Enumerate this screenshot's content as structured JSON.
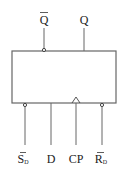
{
  "diagram": {
    "type": "D flip-flop logic symbol",
    "outputs": [
      {
        "label": "Q",
        "overbar": true,
        "inverted_bubble": true
      },
      {
        "label": "Q",
        "overbar": false,
        "inverted_bubble": false
      }
    ],
    "inputs": [
      {
        "label": "S",
        "subscript": "D",
        "overbar": true,
        "inverted_bubble": true
      },
      {
        "label": "D",
        "subscript": "",
        "overbar": false,
        "inverted_bubble": false
      },
      {
        "label": "CP",
        "subscript": "",
        "overbar": false,
        "clock_triangle": true
      },
      {
        "label": "R",
        "subscript": "D",
        "overbar": true,
        "inverted_bubble": true
      }
    ],
    "line_color": "#666666"
  }
}
